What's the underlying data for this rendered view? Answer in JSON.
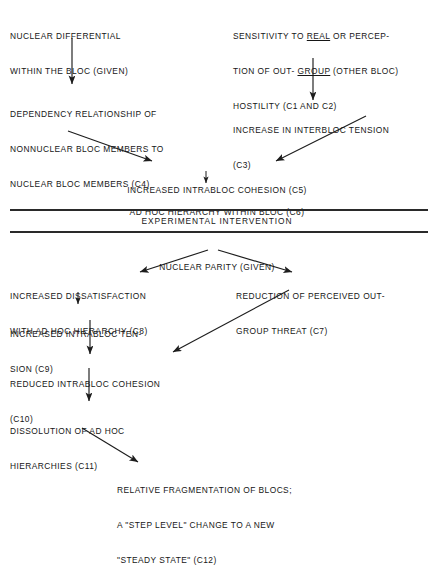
{
  "figure": {
    "type": "flowchart",
    "title": "",
    "band_label": "EXPERIMENTAL INTERVENTION"
  },
  "nodes": {
    "n1": {
      "id": "GIVEN",
      "lines": [
        "NUCLEAR DIFFERENTIAL",
        "WITHIN THE BLOC (GIVEN)"
      ]
    },
    "n2_pre": "SENSITIVITY TO ",
    "n2_u1": "REAL",
    "n2_mid": " OR PERCEP-",
    "n2_l2a": "TION OF OUT- ",
    "n2_u2": "GROUP",
    "n2_l2b": " (OTHER BLOC)",
    "n2_l3": "HOSTILITY (C1 AND C2)",
    "n3": {
      "id": "C4",
      "lines": [
        "DEPENDENCY RELATIONSHIP OF",
        "NONNUCLEAR BLOC MEMBERS TO",
        "NUCLEAR BLOC MEMBERS (C4)"
      ]
    },
    "n4": {
      "id": "C3",
      "lines": [
        "INCREASE IN INTERBLOC TENSION",
        "(C3)"
      ]
    },
    "n5": {
      "id": "C5",
      "lines": [
        "INCREASED INTRABLOC COHESION (C5)"
      ]
    },
    "n6": {
      "id": "C6",
      "lines": [
        "AD HOC HIERARCHY WITHIN BLOC (C6)"
      ]
    },
    "n7": {
      "id": "GIVEN",
      "lines": [
        "NUCLEAR PARITY (GIVEN)"
      ]
    },
    "n8": {
      "id": "C8",
      "lines": [
        "INCREASED DISSATISFACTION",
        "WITH AD HOC HIERARCHY (C8)"
      ]
    },
    "n9": {
      "id": "C7",
      "lines": [
        "REDUCTION OF PERCEIVED OUT-",
        "GROUP THREAT (C7)"
      ]
    },
    "n10": {
      "id": "C9",
      "lines": [
        "INCREASED INTRABLOC TEN-",
        "SION (C9)"
      ]
    },
    "n11": {
      "id": "C10",
      "lines": [
        "REDUCED INTRABLOC COHESION",
        "(C10)"
      ]
    },
    "n12": {
      "id": "C11",
      "lines": [
        "DISSOLUTION OF AD HOC",
        "HIERARCHIES (C11)"
      ]
    },
    "n13": {
      "id": "C12",
      "lines": [
        "RELATIVE FRAGMENTATION OF BLOCS;",
        "A \"STEP LEVEL\" CHANGE TO A NEW",
        "\"STEADY STATE\" (C12)"
      ]
    }
  },
  "edges": [
    {
      "from": "GIVEN-1",
      "to": "C4",
      "kind": "vertical"
    },
    {
      "from": "C1 AND C2",
      "to": "C3",
      "kind": "vertical"
    },
    {
      "from": "C4",
      "to": "C5",
      "kind": "diagonal-down-right"
    },
    {
      "from": "C3",
      "to": "C5",
      "kind": "diagonal-down-left"
    },
    {
      "from": "C5",
      "to": "C6",
      "kind": "vertical-short"
    },
    {
      "from": "GIVEN-2",
      "to": "C8",
      "kind": "diagonal-down-left"
    },
    {
      "from": "GIVEN-2",
      "to": "C7",
      "kind": "diagonal-down-right"
    },
    {
      "from": "C8",
      "to": "C9",
      "kind": "vertical-short"
    },
    {
      "from": "C9",
      "to": "C10",
      "kind": "vertical"
    },
    {
      "from": "C7",
      "to": "C10",
      "kind": "diagonal-down-left"
    },
    {
      "from": "C10",
      "to": "C11",
      "kind": "vertical"
    },
    {
      "from": "C11",
      "to": "C12",
      "kind": "diagonal-down-right"
    }
  ],
  "colors": {
    "ink": "#161616",
    "rule": "#2a2a2a",
    "background": "#ffffff"
  }
}
